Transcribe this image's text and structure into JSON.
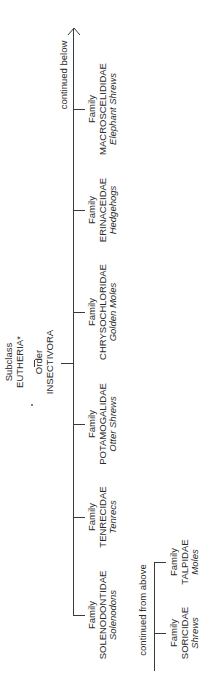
{
  "root": {
    "subclass_label": "Subclass",
    "subclass_name": "EUTHERIA*",
    "order_label": "Order",
    "order_name": "INSECTIVORA"
  },
  "continued_below": "continued below",
  "continued_from_above": "continued from above",
  "families": [
    {
      "label": "Family",
      "name": "MACROSCELIDIDAE",
      "common": "Elephant Shrews"
    },
    {
      "label": "Family",
      "name": "ERINACEIDAE",
      "common": "Hedgehogs"
    },
    {
      "label": "Family",
      "name": "CHRYSOCHLORIDAE",
      "common": "Golden Moles"
    },
    {
      "label": "Family",
      "name": "POTAMOGALIDAE",
      "common": "Otter Shrews"
    },
    {
      "label": "Family",
      "name": "TENRECIDAE",
      "common": "Tenrecs"
    },
    {
      "label": "Family",
      "name": "SOLENODONTIDAE",
      "common": "Solenodons"
    }
  ],
  "families_continued": [
    {
      "label": "Family",
      "name": "TALPIDAE",
      "common": "Moles"
    },
    {
      "label": "Family",
      "name": "SORICIDAE",
      "common": "Shrews"
    }
  ],
  "colors": {
    "line": "#3a3a3a",
    "text": "#2a2a2a",
    "background": "#ffffff"
  }
}
